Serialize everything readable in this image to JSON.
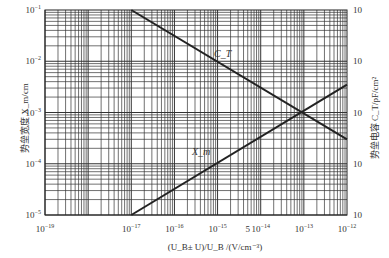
{
  "chart_data": {
    "type": "line",
    "title": "",
    "xscale": "log",
    "yscale": "log",
    "xlim": [
      1e-19,
      1e-12
    ],
    "ylim": [
      1e-05,
      0.1
    ],
    "y2lim": [
      1e-05,
      0.1
    ],
    "grid": true,
    "xlabel": "(U_B± U)/U_B /(V/cm⁻³)",
    "ylabel": "势垒宽度 X_m/cm",
    "y2label": "势垒电容 C_T/pF/cm²",
    "x_ticks": [
      {
        "value": 1e-19,
        "base": "10",
        "exp": "−19"
      },
      {
        "value": 1e-17,
        "base": "10",
        "exp": "−17"
      },
      {
        "value": 1e-16,
        "base": "10",
        "exp": "−16"
      },
      {
        "value": 1e-15,
        "base": "10",
        "exp": "−15"
      },
      {
        "value": 5e-15,
        "base": "5",
        "exp": ""
      },
      {
        "value": 1e-14,
        "base": "10",
        "exp": "−14"
      },
      {
        "value": 1e-13,
        "base": "10",
        "exp": "−13"
      },
      {
        "value": 1e-12,
        "base": "10",
        "exp": "−12"
      }
    ],
    "y_ticks": [
      {
        "value": 0.1,
        "base": "10",
        "exp": "−1"
      },
      {
        "value": 0.01,
        "base": "10",
        "exp": "−2"
      },
      {
        "value": 0.001,
        "base": "10",
        "exp": "−3"
      },
      {
        "value": 0.0001,
        "base": "10",
        "exp": "−4"
      },
      {
        "value": 1e-05,
        "base": "10",
        "exp": "−5"
      }
    ],
    "y2_ticks": [
      {
        "value": 0.1,
        "label": "10"
      },
      {
        "value": 0.01,
        "label": "10"
      },
      {
        "value": 0.001,
        "label": "10"
      },
      {
        "value": 0.0001,
        "label": "10"
      },
      {
        "value": 1e-05,
        "label": "10"
      }
    ],
    "series": [
      {
        "name": "C_T",
        "label": "C_T",
        "x": [
          1e-17,
          1e-12
        ],
        "y": [
          0.1,
          0.0003
        ]
      },
      {
        "name": "X_m",
        "label": "X_m",
        "x": [
          1e-17,
          1e-12
        ],
        "y": [
          1e-05,
          0.0035
        ]
      }
    ]
  }
}
